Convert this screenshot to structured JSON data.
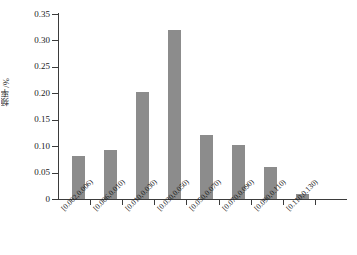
{
  "chart_data": {
    "type": "bar",
    "title": "",
    "xlabel": "",
    "ylabel": "频率/%",
    "ylim": [
      0,
      0.35
    ],
    "yticks": [
      "0",
      "0.05",
      "0.10",
      "0.15",
      "0.20",
      "0.25",
      "0.30",
      "0.35"
    ],
    "ytick_values": [
      0,
      0.05,
      0.1,
      0.15,
      0.2,
      0.25,
      0.3,
      0.35
    ],
    "grid": false,
    "legend": null,
    "categories": [
      "[0.002,0.006)",
      "[0.006,0.010)",
      "[0.010,0.030)",
      "[0.030,0.050)",
      "[0.050,0.070)",
      "[0.070,0.090)",
      "[0.090,0.110)",
      "[0.110,0.130)"
    ],
    "values": [
      0.082,
      0.093,
      0.203,
      0.32,
      0.121,
      0.103,
      0.06,
      0.01
    ],
    "bar_color": "#8c8c8c",
    "axis_color": "#3b3b3b"
  },
  "axis": {
    "y_title": "频率/%"
  }
}
